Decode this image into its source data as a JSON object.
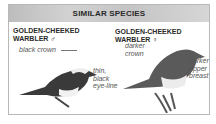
{
  "header": {
    "title": "SIMILAR SPECIES"
  },
  "species": [
    {
      "name_line1": "GOLDEN-CHEEKED",
      "name_line2": "WARBLER ♂",
      "annotations": [
        "black crown",
        "thin,",
        "black",
        "eye-line"
      ]
    },
    {
      "name": "GOLDEN-CHEEKED WARBLER ♀",
      "annotations": [
        "darker",
        "crown",
        "darker",
        "upper",
        "breast"
      ]
    }
  ],
  "colors": {
    "header_bg": "#c8c8c8",
    "border": "#b8b8b8",
    "text": "#2a2a2a"
  }
}
